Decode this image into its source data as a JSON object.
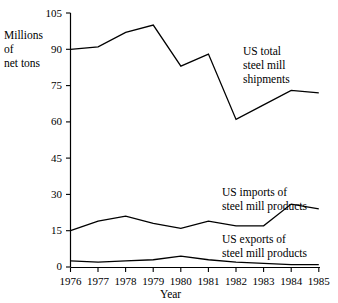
{
  "chart_data": {
    "type": "line",
    "title": "",
    "xlabel": "Year",
    "ylabel": "Millions of net tons",
    "ylabel_lines": [
      "Millions",
      "of",
      "net tons"
    ],
    "x": [
      1976,
      1977,
      1978,
      1979,
      1980,
      1981,
      1982,
      1983,
      1984,
      1985
    ],
    "categories": [
      "1976",
      "1977",
      "1978",
      "1979",
      "1980",
      "1981",
      "1982",
      "1983",
      "1984",
      "1985"
    ],
    "xlim": [
      1976,
      1985
    ],
    "ylim": [
      0,
      105
    ],
    "yticks": [
      0,
      15,
      30,
      45,
      60,
      75,
      90,
      105
    ],
    "ytick_labels": [
      "0",
      "15",
      "30",
      "45",
      "60",
      "75",
      "90",
      "105"
    ],
    "grid": false,
    "legend_position": "inline-annotations",
    "series": [
      {
        "name": "US total steel mill shipments",
        "label_lines": [
          "US total",
          "steel mill",
          "shipments"
        ],
        "values": [
          90,
          91,
          97,
          100,
          83,
          88,
          61,
          67,
          73,
          72
        ],
        "color": "#000000"
      },
      {
        "name": "US imports of steel mill products",
        "label_lines": [
          "US imports of",
          "steel mill products"
        ],
        "values": [
          15,
          19,
          21,
          18,
          16,
          19,
          17,
          17,
          26,
          24
        ],
        "color": "#000000"
      },
      {
        "name": "US exports of steel mill products",
        "label_lines": [
          "US exports of",
          "steel mill products"
        ],
        "values": [
          2.5,
          2,
          2.5,
          3,
          4.5,
          3,
          2,
          1.5,
          1,
          1
        ],
        "color": "#000000"
      }
    ],
    "annotations": [
      {
        "text": "US total steel mill shipments",
        "near_x": 1983,
        "near_y": 88
      },
      {
        "text": "US imports of steel mill products",
        "near_x": 1983,
        "near_y": 32
      },
      {
        "text": "US exports of steel mill products",
        "near_x": 1983,
        "near_y": 12
      }
    ]
  },
  "axis": {
    "x_title": "Year",
    "y_line1": "Millions",
    "y_line2": "of",
    "y_line3": "net tons",
    "ytick_0": "0",
    "ytick_15": "15",
    "ytick_30": "30",
    "ytick_45": "45",
    "ytick_60": "60",
    "ytick_75": "75",
    "ytick_90": "90",
    "ytick_105": "105",
    "xtick_1976": "1976",
    "xtick_1977": "1977",
    "xtick_1978": "1978",
    "xtick_1979": "1979",
    "xtick_1980": "1980",
    "xtick_1981": "1981",
    "xtick_1982": "1982",
    "xtick_1983": "1983",
    "xtick_1984": "1984",
    "xtick_1985": "1985"
  },
  "annotations": {
    "total_l1": "US total",
    "total_l2": "steel mill",
    "total_l3": "shipments",
    "imports_l1": "US imports of",
    "imports_l2": "steel mill products",
    "exports_l1": "US exports of",
    "exports_l2": "steel mill products"
  }
}
